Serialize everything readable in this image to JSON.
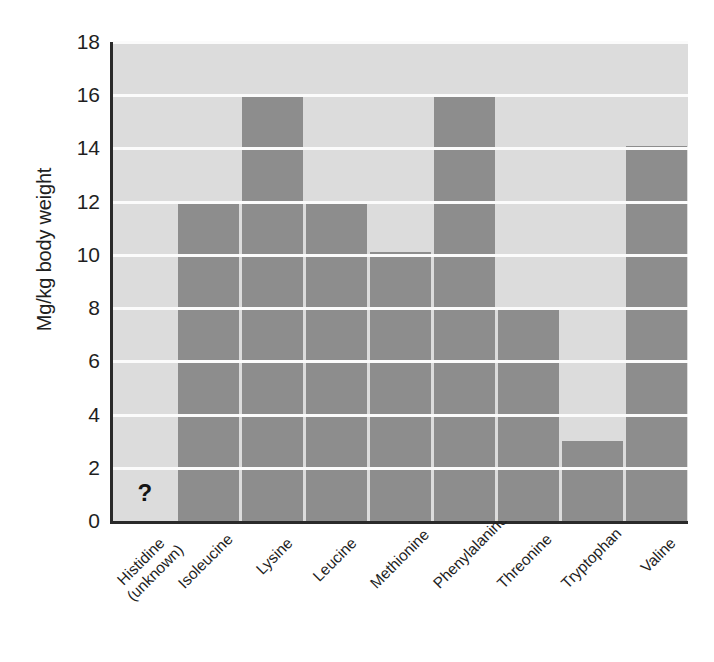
{
  "chart_data": {
    "type": "bar",
    "title": "",
    "xlabel": "",
    "ylabel": "Mg/kg body weight",
    "ylim": [
      0,
      18
    ],
    "ytick_step": 2,
    "yticks": [
      "18",
      "16",
      "14",
      "12",
      "10",
      "8",
      "6",
      "4",
      "2",
      "0"
    ],
    "grid": true,
    "legend": "none",
    "categories": [
      "Histidine (unknown)",
      "Isoleucine",
      "Lysine",
      "Leucine",
      "Methionine",
      "Phenylalanine",
      "Threonine",
      "Tryptophan",
      "Valine"
    ],
    "values": [
      null,
      12.0,
      16.0,
      12.0,
      10.1,
      16.0,
      8.0,
      3.0,
      14.1
    ],
    "annotations": [
      {
        "category": "Histidine (unknown)",
        "text": "?",
        "note": "value unknown, no bar drawn"
      }
    ],
    "bar_color": "#8d8d8d",
    "plot_background": "#dcdcdc",
    "gridline_color": "#fbfbfb",
    "axis_color": "#2a2a2a"
  },
  "axis": {
    "y_title": "Mg/kg body weight",
    "y_tick_labels": [
      "18",
      "16",
      "14",
      "12",
      "10",
      "8",
      "6",
      "4",
      "2",
      "0"
    ],
    "x_tick_labels": [
      {
        "line1": "Histidine",
        "line2": "(unknown)"
      },
      {
        "line1": "Isoleucine",
        "line2": ""
      },
      {
        "line1": "Lysine",
        "line2": ""
      },
      {
        "line1": "Leucine",
        "line2": ""
      },
      {
        "line1": "Methionine",
        "line2": ""
      },
      {
        "line1": "Phenylalanine",
        "line2": ""
      },
      {
        "line1": "Threonine",
        "line2": ""
      },
      {
        "line1": "Tryptophan",
        "line2": ""
      },
      {
        "line1": "Valine",
        "line2": ""
      }
    ]
  },
  "markers": {
    "unknown_symbol": "?"
  }
}
